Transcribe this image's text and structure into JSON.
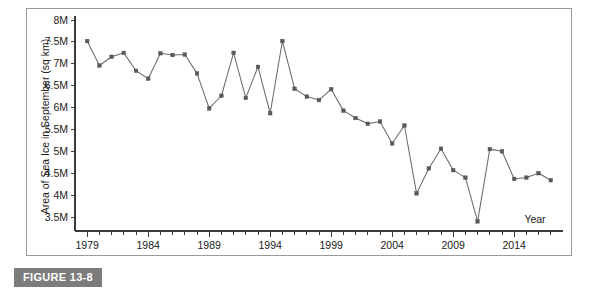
{
  "figure": {
    "caption": "FIGURE 13-8"
  },
  "chart_data": {
    "type": "line",
    "title": "",
    "xlabel": "Year",
    "ylabel": "Area of Sea Ice in September (sq km)",
    "xlim": [
      1978,
      2018
    ],
    "ylim": [
      3250000,
      8100000
    ],
    "grid": false,
    "legend": "none",
    "x_tick_labels": [
      "1979",
      "1984",
      "1989",
      "1994",
      "1999",
      "2004",
      "2009",
      "2014"
    ],
    "x_tick_values": [
      1979,
      1984,
      1989,
      1994,
      1999,
      2004,
      2009,
      2014
    ],
    "x_minor_step": 1,
    "y_tick_labels": [
      "8M",
      "7.5M",
      "7M",
      "6.5M",
      "6M",
      "5.5M",
      "5M",
      "4.5M",
      "4M",
      "3.5M"
    ],
    "y_tick_values": [
      8000000,
      7500000,
      7000000,
      6500000,
      6000000,
      5500000,
      5000000,
      4500000,
      4000000,
      3500000
    ],
    "marker": "square",
    "series": [
      {
        "name": "Area of Sea Ice in September",
        "x": [
          1979,
          1980,
          1981,
          1982,
          1983,
          1984,
          1985,
          1986,
          1987,
          1988,
          1989,
          1990,
          1991,
          1992,
          1993,
          1994,
          1995,
          1996,
          1997,
          1998,
          1999,
          2000,
          2001,
          2002,
          2003,
          2004,
          2005,
          2006,
          2007,
          2008,
          2009,
          2010,
          2011,
          2012,
          2013,
          2014,
          2015,
          2016,
          2017
        ],
        "values": [
          7520000,
          6960000,
          7160000,
          7250000,
          6840000,
          6660000,
          7240000,
          7200000,
          7210000,
          6780000,
          5980000,
          6270000,
          7250000,
          6220000,
          6930000,
          5870000,
          7520000,
          6430000,
          6250000,
          6170000,
          6420000,
          5930000,
          5760000,
          5630000,
          5680000,
          5180000,
          5590000,
          4040000,
          4610000,
          5060000,
          4570000,
          4400000,
          3400000,
          5050000,
          5000000,
          4370000,
          4400000,
          4500000,
          4340000
        ]
      }
    ]
  }
}
